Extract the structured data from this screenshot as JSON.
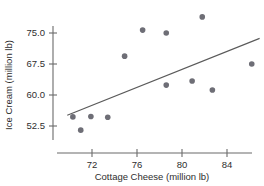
{
  "chart_data": {
    "type": "scatter",
    "title": "",
    "subtitle": "",
    "xlabel": "Cottage Cheese (million lb)",
    "ylabel": "Ice Cream (million lb)",
    "xlim": [
      69.5,
      87.5
    ],
    "ylim": [
      49.5,
      80.5
    ],
    "xticks": [
      72,
      76,
      80,
      84
    ],
    "xtick_labels": [
      "72",
      "76",
      "80",
      "84"
    ],
    "yticks": [
      52.5,
      60.0,
      67.5,
      75.0
    ],
    "ytick_labels": [
      "52.5",
      "60.0",
      "67.5",
      "75.0"
    ],
    "grid": false,
    "legend": null,
    "marker_color": "#6e6e76",
    "line_color": "#5a5a5a",
    "axis_color": "#6b6b6b",
    "points": [
      {
        "x": 70.3,
        "y": 54.7
      },
      {
        "x": 71.0,
        "y": 51.5
      },
      {
        "x": 71.9,
        "y": 54.8
      },
      {
        "x": 73.4,
        "y": 54.6
      },
      {
        "x": 74.9,
        "y": 69.4
      },
      {
        "x": 76.5,
        "y": 75.7
      },
      {
        "x": 78.6,
        "y": 75.0
      },
      {
        "x": 78.6,
        "y": 62.4
      },
      {
        "x": 80.9,
        "y": 63.4
      },
      {
        "x": 81.8,
        "y": 78.9
      },
      {
        "x": 82.7,
        "y": 61.2
      },
      {
        "x": 86.2,
        "y": 67.5
      }
    ],
    "trendline": {
      "type": "linear-fit",
      "x0": 69.8,
      "y0": 55.1,
      "x1": 86.9,
      "y1": 73.7
    }
  }
}
